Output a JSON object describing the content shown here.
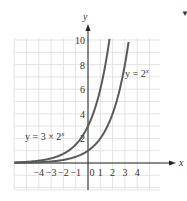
{
  "chart_data": {
    "type": "line",
    "title": "",
    "xlabel": "x",
    "ylabel": "y",
    "xlim": [
      -6,
      6
    ],
    "ylim": [
      -2.2,
      10.2
    ],
    "grid": true,
    "x_tick_labels": [
      "−4",
      "−3",
      "−2",
      "−1",
      "0",
      "1",
      "2",
      "3",
      "4"
    ],
    "x_ticks": [
      -4,
      -3,
      -2,
      -1,
      0,
      1,
      2,
      3,
      4
    ],
    "y_tick_labels": [
      "2",
      "4",
      "6",
      "8",
      "10"
    ],
    "y_ticks": [
      2,
      4,
      6,
      8,
      10
    ],
    "series": [
      {
        "name": "y = 2^x",
        "label": "y = 2",
        "label_exp": "x",
        "formula": "2^x",
        "x": [
          -6,
          -5,
          -4,
          -3,
          -2,
          -1,
          0,
          1,
          2,
          3,
          3.32
        ],
        "values": [
          0.016,
          0.031,
          0.063,
          0.125,
          0.25,
          0.5,
          1,
          2,
          4,
          8,
          10
        ]
      },
      {
        "name": "y = 3 × 2^x",
        "label": "y = 3 × 2",
        "label_exp": "x",
        "formula": "3*2^x",
        "x": [
          -6,
          -5,
          -4,
          -3,
          -2,
          -1,
          0,
          1,
          1.74
        ],
        "values": [
          0.047,
          0.094,
          0.188,
          0.375,
          0.75,
          1.5,
          3,
          6,
          10
        ]
      }
    ],
    "colors": {
      "curve": "#5a5a5a",
      "axis": "#222222",
      "grid": "#dcdcdc",
      "text": "#333333"
    }
  },
  "corner_mark": "▼"
}
